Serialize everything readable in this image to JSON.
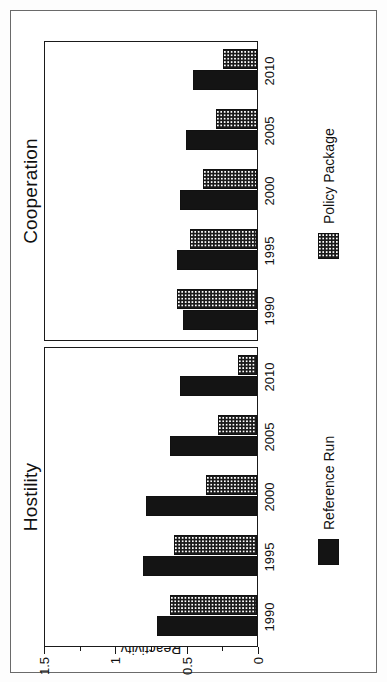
{
  "figure": {
    "value_axis_title": "Reactivity",
    "ticks": [
      "1.5",
      "1",
      "0.5",
      "0"
    ],
    "tick_values": [
      1.5,
      1,
      0.5,
      0
    ],
    "minor_tick_values": [
      1.25,
      0.75,
      0.25
    ]
  },
  "legend": {
    "reference": {
      "label": "Reference Run",
      "swatch": "solid-black-swatch",
      "color": "#141414"
    },
    "policy": {
      "label": "Policy Package",
      "swatch": "checkered-swatch",
      "color": "#1a1a1a"
    }
  },
  "panels": [
    {
      "id": "hostility",
      "title": "Hostility"
    },
    {
      "id": "cooperation",
      "title": "Cooperation"
    }
  ],
  "chart_data": {
    "type": "bar",
    "title": "",
    "subtitle": "",
    "xlabel": "",
    "ylabel": "Reactivity",
    "ylim": [
      0,
      1.5
    ],
    "yticks": [
      0,
      0.5,
      1,
      1.5
    ],
    "ytick_labels": [
      "0",
      "0.5",
      "1",
      "1.5"
    ],
    "minor_yticks": [
      0.25,
      0.75,
      1.25
    ],
    "grid": false,
    "orientation": "vertical-bars-in-upright-figure",
    "legend_position": "below-each-panel",
    "categories": [
      "1990",
      "1995",
      "2000",
      "2005",
      "2010"
    ],
    "panels": [
      {
        "name": "Hostility",
        "series": [
          {
            "name": "Reference Run",
            "values": [
              0.7,
              0.8,
              0.78,
              0.61,
              0.54
            ]
          },
          {
            "name": "Policy Package",
            "values": [
              0.61,
              0.58,
              0.36,
              0.27,
              0.13
            ]
          }
        ]
      },
      {
        "name": "Cooperation",
        "series": [
          {
            "name": "Reference Run",
            "values": [
              0.52,
              0.56,
              0.54,
              0.5,
              0.45
            ]
          },
          {
            "name": "Policy Package",
            "values": [
              0.56,
              0.47,
              0.38,
              0.29,
              0.24
            ]
          }
        ]
      }
    ]
  }
}
